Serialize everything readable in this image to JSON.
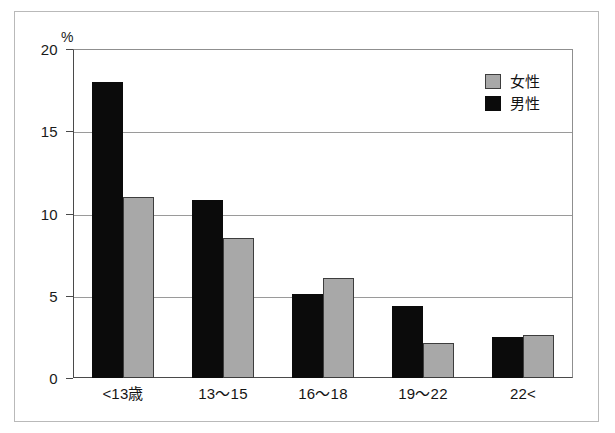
{
  "chart_data": {
    "type": "bar",
    "title": "",
    "subtitle": "",
    "xlabel": "",
    "ylabel": "%",
    "ylim": [
      0,
      20
    ],
    "yticks": [
      0,
      5,
      10,
      15,
      20
    ],
    "ytick_labels": [
      "0",
      "5",
      "10",
      "15",
      "20"
    ],
    "grid": true,
    "legend_position": "top-right",
    "categories": [
      "<13歳",
      "13～15",
      "16～18",
      "19～22",
      "22<"
    ],
    "series": [
      {
        "name": "男性",
        "color": "#0b0b0b",
        "values": [
          18.0,
          10.8,
          5.1,
          4.4,
          2.5
        ]
      },
      {
        "name": "女性",
        "color": "#a8a8a8",
        "values": [
          11.0,
          8.5,
          6.1,
          2.1,
          2.6
        ]
      }
    ]
  },
  "axis": {
    "unit_label": "%"
  },
  "legend": {
    "entries": [
      {
        "label": "女性",
        "swatch": "female"
      },
      {
        "label": "男性",
        "swatch": "male"
      }
    ]
  },
  "colors": {
    "male": "#0b0b0b",
    "female": "#a8a8a8",
    "gridline": "#9a9a9a",
    "axis": "#4a4a4a",
    "frame": "#b9b9b9",
    "background": "#ffffff"
  }
}
